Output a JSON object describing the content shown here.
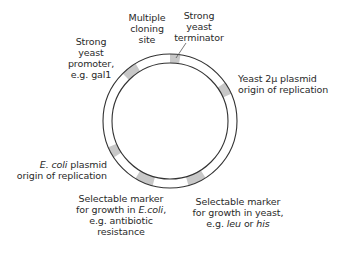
{
  "diagram": {
    "ring": {
      "cx": 170,
      "cy": 121,
      "r_outer": 67,
      "r_inner": 58,
      "stroke": "#333333",
      "segment_fill": "#c8c8c8"
    },
    "segments": [
      {
        "id": "terminator",
        "start": 0,
        "end": 9
      },
      {
        "id": "yeast-2u-origin",
        "start": 55,
        "end": 66
      },
      {
        "id": "yeast-marker",
        "start": 148,
        "end": 164
      },
      {
        "id": "ecoli-marker",
        "start": 195,
        "end": 211
      },
      {
        "id": "ecoli-origin",
        "start": 237,
        "end": 247
      },
      {
        "id": "promoter",
        "start": 315,
        "end": 329
      }
    ],
    "labels": {
      "mcs": [
        "Multiple",
        "cloning",
        "site"
      ],
      "promoter": [
        "Strong",
        "yeast",
        "promoter,",
        "e.g. gal1"
      ],
      "terminator": [
        "Strong",
        "yeast",
        "terminator"
      ],
      "yeast_origin": [
        "Yeast 2μ plasmid",
        "origin of replication"
      ],
      "ecoli_origin": {
        "line1_italic": "E. coli",
        "line1_rest": " plasmid",
        "line2": "origin of replication"
      },
      "ecoli_marker": {
        "line1": "Selectable marker",
        "line2_pre": "for growth in ",
        "line2_italic": "E.coli",
        "line2_post": ",",
        "line3": "e.g. antibiotic",
        "line4": "resistance"
      },
      "yeast_marker": {
        "line1": "Selectable marker",
        "line2": "for growth in yeast,",
        "line3_pre": "e.g. ",
        "line3_it1": "leu",
        "line3_mid": " or ",
        "line3_it2": "his"
      }
    }
  }
}
